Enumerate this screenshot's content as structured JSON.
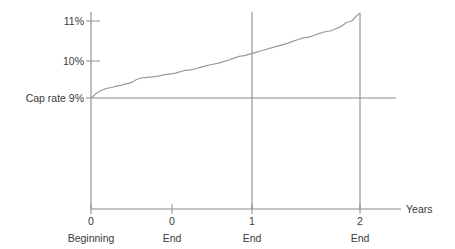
{
  "chart_data": {
    "type": "line",
    "title": "",
    "subtitle": "",
    "xlabel": "Years",
    "ylabel": "",
    "xlim": [
      0,
      2.5
    ],
    "ylim": [
      6.0,
      11.6
    ],
    "grid": false,
    "legend": null,
    "y_ticks": [
      {
        "value": 11,
        "label": "11%"
      },
      {
        "value": 10,
        "label": "10%"
      },
      {
        "value": 9,
        "label": "Cap rate 9%"
      }
    ],
    "x_ticks": [
      {
        "value": 0.0,
        "number": "0",
        "period": "Beginning"
      },
      {
        "value": 0.62,
        "number": "0",
        "period": "End"
      },
      {
        "value": 1.0,
        "number": "1",
        "period": "End"
      },
      {
        "value": 2.0,
        "number": "2",
        "period": "End"
      }
    ],
    "reference_lines": [
      {
        "name": "cap-rate-9-percent",
        "orientation": "horizontal",
        "value": 9
      },
      {
        "name": "year-1-end-marker",
        "orientation": "vertical",
        "value": 1.0
      },
      {
        "name": "year-2-end-marker",
        "orientation": "vertical",
        "value": 2.0
      }
    ],
    "series": [
      {
        "name": "cap-rate-curve",
        "x": [
          0.0,
          0.02,
          0.04,
          0.06,
          0.08,
          0.1,
          0.13,
          0.16,
          0.19,
          0.22,
          0.25,
          0.28,
          0.31,
          0.34,
          0.37,
          0.4,
          0.43,
          0.46,
          0.5,
          0.54,
          0.58,
          0.62,
          0.66,
          0.7,
          0.74,
          0.78,
          0.82,
          0.86,
          0.9,
          0.94,
          0.98,
          1.02,
          1.06,
          1.1,
          1.14,
          1.18,
          1.22,
          1.26,
          1.3,
          1.34,
          1.38,
          1.42,
          1.46,
          1.5,
          1.54,
          1.58,
          1.62,
          1.66,
          1.7,
          1.74,
          1.78,
          1.82,
          1.86,
          1.9,
          1.94,
          1.97,
          2.0
        ],
        "y": [
          9.0,
          9.06,
          9.12,
          9.17,
          9.2,
          9.23,
          9.26,
          9.28,
          9.31,
          9.33,
          9.36,
          9.38,
          9.42,
          9.48,
          9.52,
          9.53,
          9.54,
          9.55,
          9.57,
          9.6,
          9.62,
          9.64,
          9.68,
          9.72,
          9.73,
          9.76,
          9.8,
          9.84,
          9.87,
          9.9,
          9.94,
          9.98,
          10.03,
          10.08,
          10.1,
          10.14,
          10.18,
          10.22,
          10.26,
          10.3,
          10.34,
          10.38,
          10.42,
          10.47,
          10.52,
          10.56,
          10.58,
          10.63,
          10.68,
          10.72,
          10.74,
          10.8,
          10.86,
          10.96,
          11.0,
          11.12,
          11.2
        ]
      }
    ],
    "colors": {
      "axis": "#8c8c8c",
      "curve": "#9a9a9a",
      "reference": "#8c8c8c",
      "text": "#3a3a3a",
      "background": "#ffffff"
    }
  }
}
